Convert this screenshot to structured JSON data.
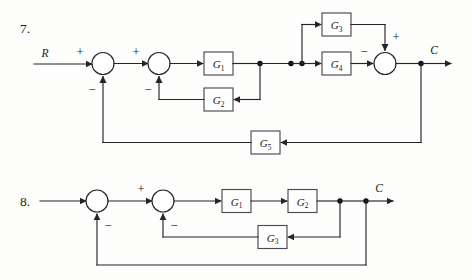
{
  "page": {
    "background_color": "#fdfdfc",
    "ink_color": "#25242a",
    "block_border_color": "#4c4b51"
  },
  "problems": [
    {
      "number": "7.",
      "input_label": "R",
      "output_label": "C",
      "blocks": [
        {
          "id": "g1",
          "base": "G",
          "sub": "1"
        },
        {
          "id": "g2",
          "base": "G",
          "sub": "2"
        },
        {
          "id": "g3",
          "base": "G",
          "sub": "3"
        },
        {
          "id": "g4",
          "base": "G",
          "sub": "4"
        },
        {
          "id": "g5",
          "base": "G",
          "sub": "5"
        }
      ],
      "summing_junctions": [
        {
          "id": "sum1",
          "signs": [
            "+",
            "−"
          ]
        },
        {
          "id": "sum2",
          "signs": [
            "+",
            "−"
          ]
        },
        {
          "id": "sum3",
          "signs": [
            "−",
            "+"
          ]
        }
      ],
      "signs": {
        "sum1_in": "+",
        "sum1_fb": "−",
        "sum2_in": "+",
        "sum2_fb": "−",
        "sum3_left": "−",
        "sum3_top": "+"
      }
    },
    {
      "number": "8.",
      "input_label": "",
      "output_label": "C",
      "blocks": [
        {
          "id": "g1",
          "base": "G",
          "sub": "1"
        },
        {
          "id": "g2",
          "base": "G",
          "sub": "2"
        },
        {
          "id": "g3",
          "base": "G",
          "sub": "3"
        }
      ],
      "summing_junctions": [
        {
          "id": "sum1",
          "signs": [
            "−"
          ]
        },
        {
          "id": "sum2",
          "signs": [
            "+",
            "−"
          ]
        }
      ],
      "signs": {
        "sum1_fb": "−",
        "sum2_in": "+",
        "sum2_fb": "−"
      }
    }
  ]
}
